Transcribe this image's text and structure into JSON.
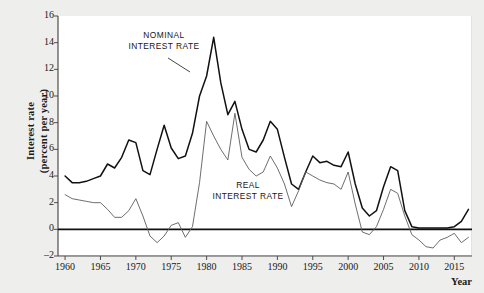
{
  "figure": {
    "background": "#eeeeec",
    "panel_background": "#ffffff"
  },
  "axes": {
    "ylabel_line1": "Interest rate",
    "ylabel_line2": "(percent per year)",
    "xlabel": "Year",
    "yticks": [
      -2,
      0,
      2,
      4,
      6,
      8,
      10,
      12,
      14,
      16
    ],
    "ytick_labels": [
      "–2",
      "0",
      "2",
      "4",
      "6",
      "8",
      "10",
      "12",
      "14",
      "16"
    ],
    "xticks": [
      1960,
      1965,
      1970,
      1975,
      1980,
      1985,
      1990,
      1995,
      2000,
      2005,
      2010,
      2015
    ],
    "xtick_labels": [
      "1960",
      "1965",
      "1970",
      "1975",
      "1980",
      "1985",
      "1990",
      "1995",
      "2000",
      "2005",
      "2010",
      "2015"
    ],
    "xlim": [
      1959,
      2017.5
    ],
    "ylim": [
      -2,
      16
    ],
    "zero_line_value": 0,
    "grid": false
  },
  "annotations": [
    {
      "id": "nominal",
      "line1": "NOMINAL",
      "line2": "INTEREST RATE",
      "color": "#161616"
    },
    {
      "id": "real",
      "line1": "REAL",
      "line2": "INTEREST RATE",
      "color": "#161616"
    }
  ],
  "chart_data": {
    "type": "line",
    "title": "",
    "xlabel": "Year",
    "ylabel": "Interest rate (percent per year)",
    "xlim": [
      1959,
      2017.5
    ],
    "ylim": [
      -2,
      16
    ],
    "grid": false,
    "legend_position": "inline-annotation",
    "x": [
      1960,
      1961,
      1962,
      1963,
      1964,
      1965,
      1966,
      1967,
      1968,
      1969,
      1970,
      1971,
      1972,
      1973,
      1974,
      1975,
      1976,
      1977,
      1978,
      1979,
      1980,
      1981,
      1982,
      1983,
      1984,
      1985,
      1986,
      1987,
      1988,
      1989,
      1990,
      1991,
      1992,
      1993,
      1994,
      1995,
      1996,
      1997,
      1998,
      1999,
      2000,
      2001,
      2002,
      2003,
      2004,
      2005,
      2006,
      2007,
      2008,
      2009,
      2010,
      2011,
      2012,
      2013,
      2014,
      2015,
      2016,
      2017
    ],
    "series": [
      {
        "name": "NOMINAL INTEREST RATE",
        "color": "#111111",
        "width": 1.5,
        "values": [
          4.0,
          3.5,
          3.5,
          3.6,
          3.8,
          4.0,
          4.9,
          4.6,
          5.4,
          6.7,
          6.5,
          4.4,
          4.1,
          6.0,
          7.8,
          6.1,
          5.3,
          5.5,
          7.2,
          10.0,
          11.5,
          14.4,
          11.0,
          8.6,
          9.6,
          7.5,
          6.0,
          5.8,
          6.7,
          8.1,
          7.5,
          5.4,
          3.4,
          3.0,
          4.3,
          5.5,
          5.0,
          5.1,
          4.8,
          4.7,
          5.8,
          3.4,
          1.6,
          1.0,
          1.4,
          3.2,
          4.7,
          4.4,
          1.4,
          0.2,
          0.1,
          0.1,
          0.1,
          0.1,
          0.1,
          0.2,
          0.6,
          1.5
        ]
      },
      {
        "name": "REAL INTEREST RATE",
        "color": "#5d5d5d",
        "width": 0.9,
        "values": [
          2.6,
          2.3,
          2.2,
          2.1,
          2.0,
          2.0,
          1.5,
          0.9,
          0.9,
          1.4,
          2.3,
          1.0,
          -0.5,
          -1.0,
          -0.5,
          0.3,
          0.5,
          -0.6,
          0.2,
          3.5,
          8.1,
          7.0,
          6.0,
          5.2,
          8.7,
          5.4,
          4.5,
          4.0,
          4.3,
          5.5,
          4.6,
          3.4,
          1.7,
          2.9,
          4.3,
          4.0,
          3.7,
          3.5,
          3.4,
          3.0,
          4.3,
          1.9,
          -0.2,
          -0.4,
          0.2,
          1.5,
          3.0,
          2.7,
          1.0,
          -0.4,
          -0.8,
          -1.3,
          -1.4,
          -0.8,
          -0.6,
          -0.3,
          -1.0,
          -0.6
        ]
      }
    ]
  }
}
